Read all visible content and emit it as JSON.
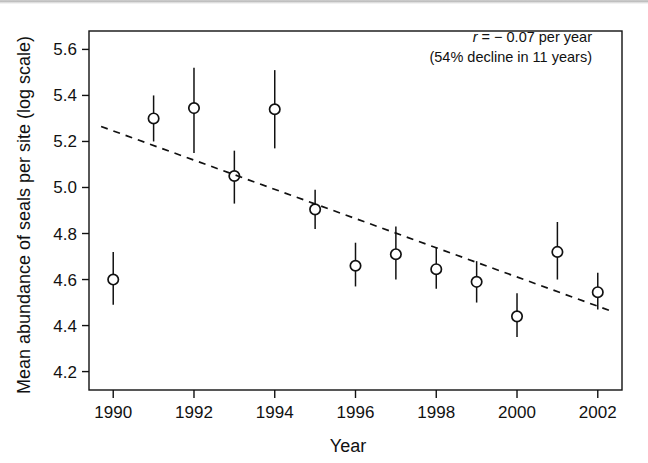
{
  "figure": {
    "name": "seal-abundance-trend-figure",
    "background_color": "#ffffff",
    "ink_color": "#111111"
  },
  "annotation": {
    "line1_prefix": "r",
    "line1_rest": " = − 0.07 per year",
    "line2": "(54% decline in 11 years)"
  },
  "chart_data": {
    "type": "scatter",
    "title": "",
    "xlabel": "Year",
    "ylabel": "Mean abundance of seals per site (log scale)",
    "xlim": [
      1989.4,
      2002.6
    ],
    "ylim": [
      4.12,
      5.68
    ],
    "grid": false,
    "legend": "none",
    "xticks": [
      1990,
      1992,
      1994,
      1996,
      1998,
      2000,
      2002
    ],
    "xtick_labels": [
      "1990",
      "1992",
      "1994",
      "1996",
      "1998",
      "2000",
      "2002"
    ],
    "xticks_minor": [
      1991,
      1993,
      1995,
      1997,
      1999,
      2001
    ],
    "yticks": [
      4.2,
      4.4,
      4.6,
      4.8,
      5.0,
      5.2,
      5.4,
      5.6
    ],
    "ytick_labels": [
      "4.2",
      "4.4",
      "4.6",
      "4.8",
      "5.0",
      "5.2",
      "5.4",
      "5.6"
    ],
    "marker": "open-circle",
    "errorbar": "vertical-line",
    "x": [
      1990,
      1991,
      1992,
      1993,
      1994,
      1995,
      1996,
      1997,
      1998,
      1999,
      2000,
      2001,
      2002
    ],
    "values": [
      4.6,
      5.3,
      5.345,
      5.05,
      5.34,
      4.905,
      4.66,
      4.71,
      4.645,
      4.59,
      4.44,
      4.72,
      4.545
    ],
    "err_low": [
      4.49,
      5.2,
      5.15,
      4.93,
      5.17,
      4.82,
      4.57,
      4.6,
      4.56,
      4.5,
      4.35,
      4.6,
      4.47
    ],
    "err_high": [
      4.72,
      5.4,
      5.52,
      5.16,
      5.51,
      4.99,
      4.76,
      4.83,
      4.74,
      4.68,
      4.54,
      4.85,
      4.63
    ],
    "trend": {
      "style": "dashed",
      "slope_per_year": -0.07,
      "x_start": 1989.7,
      "y_start": 5.265,
      "x_end": 2002.3,
      "y_end": 4.465
    }
  }
}
